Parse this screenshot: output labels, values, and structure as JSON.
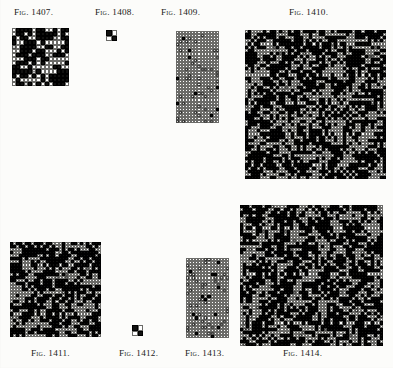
{
  "page": {
    "width": 393,
    "height": 368,
    "background_color": "#fcfcfa",
    "ink_color": "#111110",
    "grid_line_color": "#6b6b68"
  },
  "figures": [
    {
      "id": "fig-1407",
      "label": "Fig. 1407.",
      "label_x": 14,
      "label_y": 7,
      "grid_x": 12,
      "grid_y": 28,
      "grid_w": 57,
      "grid_h": 58,
      "cols": 14,
      "rows": 14,
      "density": 0.5,
      "style": "mixed",
      "seed": 1407
    },
    {
      "id": "fig-1408",
      "label": "Fig. 1408.",
      "label_x": 95,
      "label_y": 7,
      "grid_x": 106,
      "grid_y": 30,
      "grid_w": 11,
      "grid_h": 11,
      "cols": 2,
      "rows": 2,
      "density": 0.5,
      "style": "explicit",
      "cells": [
        [
          1,
          0
        ],
        [
          0,
          1
        ]
      ],
      "seed": 1408
    },
    {
      "id": "fig-1409",
      "label": "Fig. 1409.",
      "label_x": 161,
      "label_y": 7,
      "grid_x": 176,
      "grid_y": 31,
      "grid_w": 43,
      "grid_h": 92,
      "cols": 14,
      "rows": 30,
      "density": 0.11,
      "style": "sparse",
      "seed": 1409
    },
    {
      "id": "fig-1410",
      "label": "Fig. 1410.",
      "label_x": 289,
      "label_y": 7,
      "grid_x": 245,
      "grid_y": 30,
      "grid_w": 141,
      "grid_h": 149,
      "cols": 46,
      "rows": 48,
      "density": 0.5,
      "style": "mixed",
      "seed": 1410
    },
    {
      "id": "fig-1411",
      "label": "Fig. 1411.",
      "label_x": 31,
      "label_y": 348,
      "grid_x": 10,
      "grid_y": 242,
      "grid_w": 91,
      "grid_h": 95,
      "cols": 30,
      "rows": 31,
      "density": 0.5,
      "style": "mixed",
      "seed": 1411
    },
    {
      "id": "fig-1412",
      "label": "Fig. 1412.",
      "label_x": 119,
      "label_y": 348,
      "grid_x": 132,
      "grid_y": 325,
      "grid_w": 11,
      "grid_h": 11,
      "cols": 2,
      "rows": 2,
      "density": 0.5,
      "style": "explicit",
      "cells": [
        [
          1,
          0
        ],
        [
          0,
          1
        ]
      ],
      "seed": 1412
    },
    {
      "id": "fig-1413",
      "label": "Fig. 1413.",
      "label_x": 185,
      "label_y": 348,
      "grid_x": 186,
      "grid_y": 258,
      "grid_w": 43,
      "grid_h": 80,
      "cols": 14,
      "rows": 26,
      "density": 0.11,
      "style": "sparse",
      "seed": 1413
    },
    {
      "id": "fig-1414",
      "label": "Fig. 1414.",
      "label_x": 283,
      "label_y": 348,
      "grid_x": 240,
      "grid_y": 205,
      "grid_w": 143,
      "grid_h": 141,
      "cols": 46,
      "rows": 46,
      "density": 0.5,
      "style": "mixed",
      "seed": 1414
    }
  ]
}
